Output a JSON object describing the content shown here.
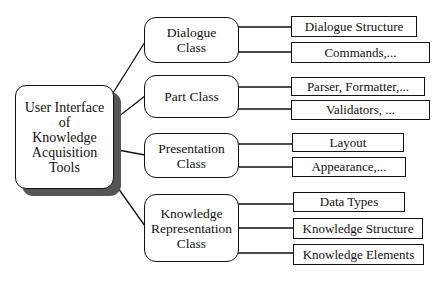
{
  "diagram": {
    "type": "tree",
    "root": {
      "label": "User Interface of Knowledge Acquisition Tools",
      "lines": [
        "User Interface",
        "of",
        "Knowledge",
        "Acquisition",
        "Tools"
      ]
    },
    "classes": [
      {
        "label": "Dialogue Class",
        "lines": [
          "Dialogue",
          "Class"
        ],
        "children": [
          "Dialogue Structure",
          "Commands,..."
        ]
      },
      {
        "label": "Part Class",
        "lines": [
          "Part Class"
        ],
        "children": [
          "Parser, Formatter,...",
          "Validators, ..."
        ]
      },
      {
        "label": "Presentation Class",
        "lines": [
          "Presentation",
          "Class"
        ],
        "children": [
          "Layout",
          "Appearance,..."
        ]
      },
      {
        "label": "Knowledge Representation Class",
        "lines": [
          "Knowledge",
          "Representation",
          "Class"
        ],
        "children": [
          "Data Types",
          "Knowledge Structure",
          "Knowledge Elements"
        ]
      }
    ]
  },
  "colors": {
    "stroke": "#111111",
    "shadow": "#555555",
    "background": "#ffffff"
  }
}
